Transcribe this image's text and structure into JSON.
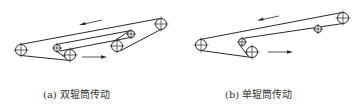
{
  "captions": {
    "a": "(a) 双辊筒传动",
    "b": "(b) 单辊筒传动"
  },
  "panels": [
    {
      "id": "a",
      "label": "双辊筒传动",
      "drums": [
        {
          "role": "tail-drum",
          "cx": 21,
          "cy": 50,
          "r": 5.5
        },
        {
          "role": "head-drum",
          "cx": 161,
          "cy": 24,
          "r": 5.5
        },
        {
          "role": "snub-idler-1",
          "cx": 57,
          "cy": 48,
          "r": 3.5
        },
        {
          "role": "drive-drum-1",
          "cx": 70,
          "cy": 55,
          "r": 5.5
        },
        {
          "role": "snub-idler-2",
          "cx": 131,
          "cy": 34,
          "r": 3.5
        },
        {
          "role": "drive-drum-2",
          "cx": 117,
          "cy": 46,
          "r": 5.5
        }
      ],
      "arrows": [
        {
          "direction": "left",
          "meaning": "carrying-side travel"
        },
        {
          "direction": "right",
          "meaning": "return-side travel"
        }
      ]
    },
    {
      "id": "b",
      "label": "单辊筒传动",
      "drums": [
        {
          "role": "tail-drum",
          "cx": 201,
          "cy": 45,
          "r": 5.5
        },
        {
          "role": "head-drum",
          "cx": 343,
          "cy": 18,
          "r": 5.5
        },
        {
          "role": "snub-idler",
          "cx": 242,
          "cy": 42,
          "r": 3.5
        },
        {
          "role": "drive-drum",
          "cx": 252,
          "cy": 52,
          "r": 5.5
        },
        {
          "role": "return-idler",
          "cx": 318,
          "cy": 30,
          "r": 3.5
        }
      ],
      "arrows": [
        {
          "direction": "left",
          "meaning": "carrying-side travel"
        },
        {
          "direction": "right",
          "meaning": "return-side travel"
        }
      ]
    }
  ],
  "colors": {
    "line": "#2a2a2a",
    "background": "#ffffff",
    "caption": "#333333"
  }
}
